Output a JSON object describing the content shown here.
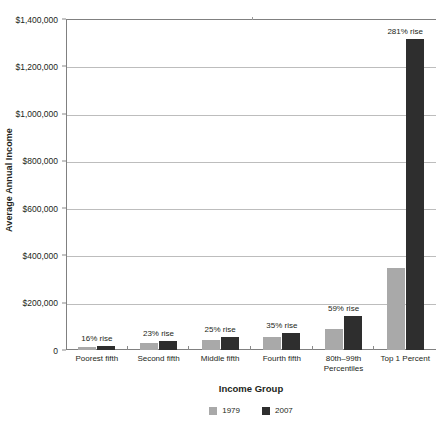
{
  "chart_data": {
    "type": "bar",
    "title": "",
    "xlabel": "Income Group",
    "ylabel": "Average Annual Income",
    "ylim": [
      0,
      1400000
    ],
    "ytick_labels": [
      "$1,400,000",
      "$1,200,000",
      "$1,000,000",
      "$800,000",
      "$600,000",
      "$400,000",
      "$200,000",
      "0"
    ],
    "ytick_values": [
      1400000,
      1200000,
      1000000,
      800000,
      600000,
      400000,
      200000,
      0
    ],
    "grid": true,
    "legend_position": "bottom",
    "categories": [
      "Poorest fifth",
      "Second fifth",
      "Middle fifth",
      "Fourth fifth",
      "80th–99th Percentiles",
      "Top 1 Percent"
    ],
    "series": [
      {
        "name": "1979",
        "color": "#a9a9a9",
        "values": [
          14800,
          29500,
          43500,
          54000,
          90000,
          345000
        ]
      },
      {
        "name": "2007",
        "color": "#2e2e2e",
        "values": [
          17200,
          36300,
          54400,
          72900,
          143100,
          1315000
        ]
      }
    ],
    "annotations": [
      "16% rise",
      "23% rise",
      "25% rise",
      "35% rise",
      "59% rise",
      "281% rise"
    ]
  },
  "legend": {
    "items": [
      {
        "label": "1979",
        "color": "#a9a9a9"
      },
      {
        "label": "2007",
        "color": "#2e2e2e"
      }
    ]
  }
}
